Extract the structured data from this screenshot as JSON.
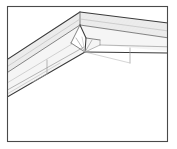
{
  "figure": {
    "title": "Roof ridge corner construction detail",
    "kind": "technical-line-drawing",
    "orientation": "isometric perspective view from below",
    "background_color": "#ffffff",
    "frame": {
      "present": true,
      "color": "#4a4a4a",
      "x": 7,
      "y": 6,
      "width": 161,
      "height": 136
    },
    "line_colors": {
      "heavy": "#3a3a3a",
      "mid": "#6e6e6e",
      "light": "#9a9a9a",
      "faint": "#b8b8b8"
    },
    "fill_colors": {
      "shaded_band": "#e9e9e9",
      "pale_band": "#f4f4f4",
      "white_face": "#ffffff"
    },
    "geometry": {
      "apex": {
        "x": 80,
        "y": 12
      },
      "inner_node": {
        "x": 85,
        "y": 52
      },
      "left_wing_direction": "down-left",
      "right_wing_direction": "down-right",
      "band_count_left": 4,
      "band_count_right": 3
    },
    "elements": [
      {
        "name": "outer-frame",
        "description": "thin rectangular border enclosing the drawing"
      },
      {
        "name": "ridge-apex",
        "description": "peak where the two roof slopes meet"
      },
      {
        "name": "left-roof-slope",
        "description": "shaded fascia band running down to the left"
      },
      {
        "name": "right-roof-slope",
        "description": "shaded fascia band running down to the right"
      },
      {
        "name": "soffit-underside",
        "description": "pale underside plane below the fascia"
      },
      {
        "name": "corner-junction",
        "description": "node where ridge, hip and valley lines converge"
      },
      {
        "name": "hip-rafter-lines",
        "description": "converging construction lines from the junction"
      }
    ],
    "labels": [],
    "annotations": []
  }
}
